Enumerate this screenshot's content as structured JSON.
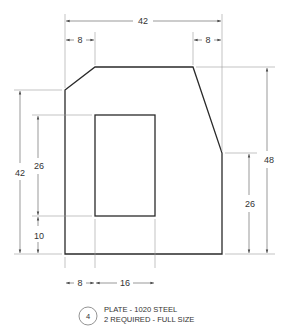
{
  "drawing": {
    "type": "technical-drawing",
    "part": {
      "number": "4",
      "title_line1": "PLATE - 1020 STEEL",
      "title_line2": "2 REQUIRED - FULL SIZE"
    },
    "dimensions": {
      "overall_width": "42",
      "top_left_chamfer": "8",
      "top_right_chamfer": "8",
      "overall_height_right": "48",
      "right_vertical_edge": "26",
      "left_vertical_edge": "42",
      "cutout_height": "26",
      "cutout_bottom_offset": "10",
      "cutout_left_offset": "8",
      "cutout_width": "16"
    }
  }
}
